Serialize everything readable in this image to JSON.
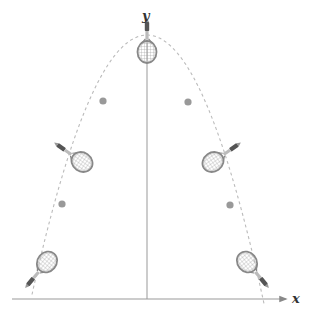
{
  "axes": {
    "x_label": "x",
    "y_label": "y",
    "origin": [
      147,
      299
    ],
    "x_range_px": [
      12,
      286
    ],
    "y_range_px": [
      18,
      299
    ],
    "color": "#999999"
  },
  "trajectory": {
    "type": "parabola",
    "style": "dashed",
    "color": "#bbbbbb",
    "vertex": [
      147,
      35
    ],
    "left_end": [
      32,
      299
    ],
    "right_end": [
      264,
      299
    ]
  },
  "markers": [
    {
      "name": "dot-upper-left",
      "x": 103,
      "y": 101
    },
    {
      "name": "dot-upper-right",
      "x": 188,
      "y": 102
    },
    {
      "name": "dot-lower-left",
      "x": 62,
      "y": 204
    },
    {
      "name": "dot-lower-right",
      "x": 230,
      "y": 205
    }
  ],
  "marker_color": "#999999",
  "rackets": [
    {
      "name": "racket-top",
      "x": 147,
      "y": 52,
      "angle": 0
    },
    {
      "name": "racket-mid-left",
      "x": 82,
      "y": 162,
      "angle": -55
    },
    {
      "name": "racket-mid-right",
      "x": 213,
      "y": 162,
      "angle": 55
    },
    {
      "name": "racket-low-left",
      "x": 47,
      "y": 262,
      "angle": -140
    },
    {
      "name": "racket-low-right",
      "x": 247,
      "y": 262,
      "angle": 140
    }
  ],
  "racket_colors": {
    "frame": "#888888",
    "strings": "#aaaaaa",
    "throat": "#bbbbbb",
    "grip": "#555555",
    "butt": "#999999"
  }
}
